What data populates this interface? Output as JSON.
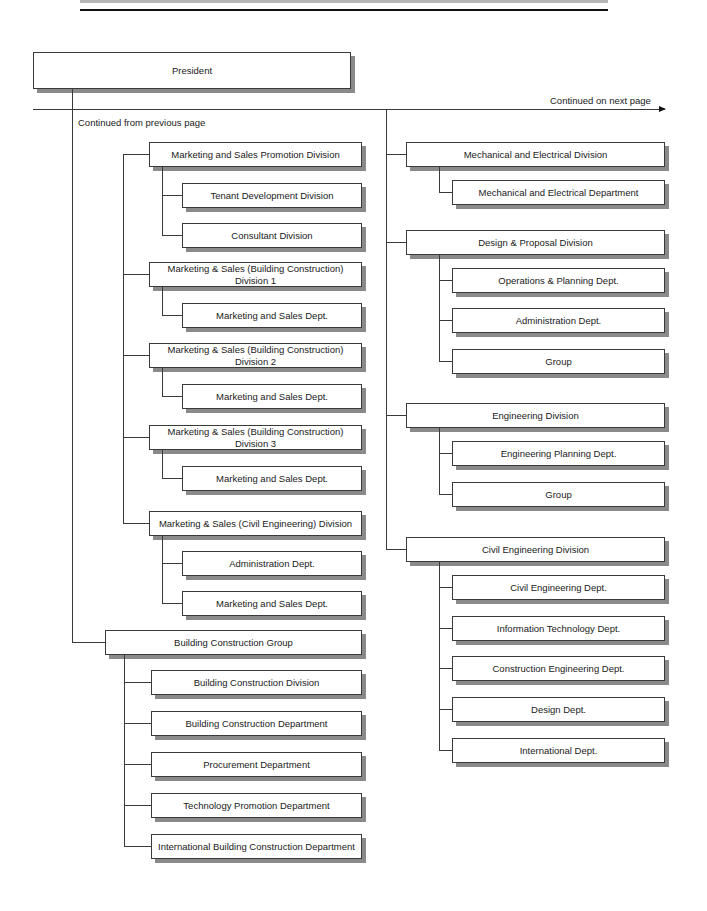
{
  "chart_title": "",
  "annotations": {
    "continued_next": "Continued on next page",
    "continued_prev": "Continued from previous page"
  },
  "root": {
    "label": "President"
  },
  "left": {
    "divisions": [
      {
        "label": "Marketing and Sales Promotion Division",
        "children": [
          "Tenant Development Division",
          "Consultant Division"
        ]
      },
      {
        "label": "Marketing & Sales (Building Construction)\nDivision 1",
        "children": [
          "Marketing and Sales Dept."
        ]
      },
      {
        "label": "Marketing & Sales (Building Construction)\nDivision 2",
        "children": [
          "Marketing and Sales Dept."
        ]
      },
      {
        "label": "Marketing & Sales (Building Construction)\nDivision 3",
        "children": [
          "Marketing and Sales Dept."
        ]
      },
      {
        "label": "Marketing & Sales (Civil Engineering) Division",
        "children": [
          "Administration Dept.",
          "Marketing and Sales Dept."
        ]
      }
    ],
    "group": {
      "label": "Building Construction Group",
      "children": [
        "Building Construction Division",
        "Building Construction Department",
        "Procurement Department",
        "Technology Promotion Department",
        "International Building Construction Department"
      ]
    }
  },
  "right": {
    "divisions": [
      {
        "label": "Mechanical and Electrical Division",
        "children": [
          "Mechanical and Electrical Department"
        ]
      },
      {
        "label": "Design & Proposal Division",
        "children": [
          "Operations & Planning Dept.",
          "Administration Dept.",
          "Group"
        ]
      },
      {
        "label": "Engineering Division",
        "children": [
          "Engineering Planning Dept.",
          "Group"
        ]
      },
      {
        "label": "Civil Engineering Division",
        "children": [
          "Civil Engineering Dept.",
          "Information Technology Dept.",
          "Construction Engineering Dept.",
          "Design Dept.",
          "International Dept."
        ]
      }
    ]
  }
}
